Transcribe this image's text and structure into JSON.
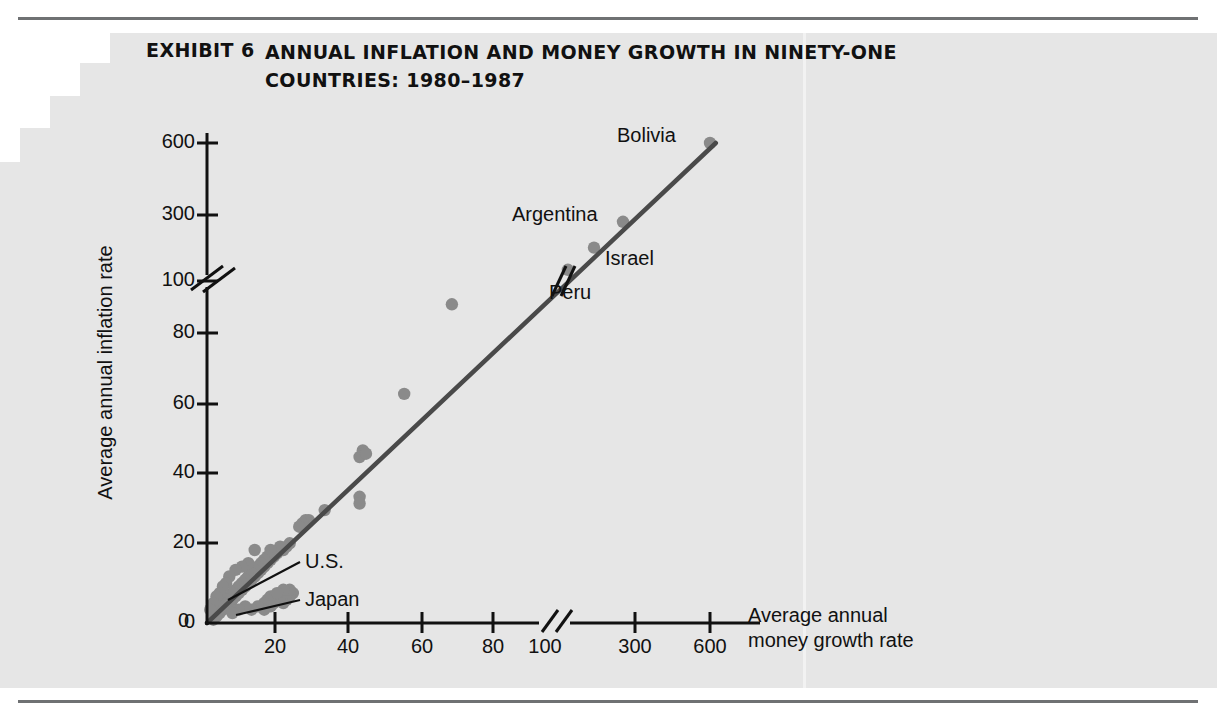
{
  "exhibit": {
    "label": "EXHIBIT 6",
    "title": "ANNUAL INFLATION AND MONEY GROWTH IN NINETY-ONE COUNTRIES: 1980–1987"
  },
  "colors": {
    "page_background": "#ffffff",
    "panel_background": "#e6e6e6",
    "rule": "#6f7173",
    "axis": "#111111",
    "point": "#8a8a8a",
    "trend_line": "#4a4a4a",
    "text": "#111111"
  },
  "chart_data": {
    "type": "scatter",
    "title": "ANNUAL INFLATION AND MONEY GROWTH IN NINETY-ONE COUNTRIES: 1980–1987",
    "xlabel": "Average annual money growth rate",
    "ylabel": "Average annual inflation rate",
    "grid": false,
    "legend": "none",
    "x_ticks": [
      "0",
      "20",
      "40",
      "60",
      "80",
      "100",
      "300",
      "600"
    ],
    "y_ticks": [
      "0",
      "20",
      "40",
      "60",
      "80",
      "100",
      "300",
      "600"
    ],
    "x_axis_break_after": "100",
    "y_axis_break_after": "100",
    "xlim": [
      0,
      600
    ],
    "ylim": [
      0,
      600
    ],
    "trend_line": {
      "description": "45-degree line of best fit from origin through Bolivia",
      "from": [
        0,
        0
      ],
      "to": [
        620,
        620
      ]
    },
    "labeled_points": [
      {
        "name": "Bolivia",
        "x": 600,
        "y": 620
      },
      {
        "name": "Argentina",
        "x": 300,
        "y": 300
      },
      {
        "name": "Israel",
        "x": 200,
        "y": 195
      },
      {
        "name": "Peru",
        "x": 110,
        "y": 105
      },
      {
        "name": "U.S.",
        "x": 8,
        "y": 5
      },
      {
        "name": "Japan",
        "x": 7,
        "y": 2
      }
    ],
    "points": [
      [
        600,
        620
      ],
      [
        300,
        300
      ],
      [
        200,
        195
      ],
      [
        110,
        105
      ],
      [
        77,
        96
      ],
      [
        62,
        69
      ],
      [
        49,
        52
      ],
      [
        49,
        51
      ],
      [
        48,
        50
      ],
      [
        50,
        51
      ],
      [
        48,
        38
      ],
      [
        48,
        36
      ],
      [
        37,
        34
      ],
      [
        32,
        31
      ],
      [
        31,
        31
      ],
      [
        30,
        30
      ],
      [
        29,
        29
      ],
      [
        26,
        24
      ],
      [
        25,
        23
      ],
      [
        24,
        22
      ],
      [
        23,
        23
      ],
      [
        22,
        21
      ],
      [
        21,
        20
      ],
      [
        20,
        22
      ],
      [
        20,
        19
      ],
      [
        19,
        20
      ],
      [
        19,
        18
      ],
      [
        18,
        19
      ],
      [
        18,
        17
      ],
      [
        17,
        18
      ],
      [
        17,
        16
      ],
      [
        16,
        17
      ],
      [
        16,
        15
      ],
      [
        15,
        16
      ],
      [
        15,
        14
      ],
      [
        14,
        15
      ],
      [
        14,
        13
      ],
      [
        13,
        14
      ],
      [
        13,
        12
      ],
      [
        12,
        13
      ],
      [
        12,
        11
      ],
      [
        11,
        12
      ],
      [
        11,
        10
      ],
      [
        10,
        11
      ],
      [
        10,
        9
      ],
      [
        9,
        10
      ],
      [
        9,
        8
      ],
      [
        8,
        9
      ],
      [
        8,
        7
      ],
      [
        7,
        8
      ],
      [
        7,
        6
      ],
      [
        6,
        7
      ],
      [
        6,
        5
      ],
      [
        5,
        6
      ],
      [
        5,
        4
      ],
      [
        4,
        5
      ],
      [
        4,
        3
      ],
      [
        3,
        4
      ],
      [
        3,
        2
      ],
      [
        2,
        3
      ],
      [
        2,
        1
      ],
      [
        27,
        9
      ],
      [
        26,
        8
      ],
      [
        25,
        7
      ],
      [
        24,
        6
      ],
      [
        23,
        8
      ],
      [
        22,
        7
      ],
      [
        21,
        6
      ],
      [
        20,
        8
      ],
      [
        19,
        7
      ],
      [
        18,
        6
      ],
      [
        26,
        10
      ],
      [
        24,
        10
      ],
      [
        22,
        9
      ],
      [
        20,
        5
      ],
      [
        18,
        4
      ],
      [
        16,
        5
      ],
      [
        14,
        4
      ],
      [
        12,
        5
      ],
      [
        10,
        4
      ],
      [
        8,
        3
      ],
      [
        13,
        18
      ],
      [
        11,
        17
      ],
      [
        9,
        16
      ],
      [
        7,
        14
      ],
      [
        6,
        12
      ],
      [
        5,
        11
      ],
      [
        4,
        9
      ],
      [
        3,
        8
      ],
      [
        2,
        6
      ],
      [
        1,
        4
      ],
      [
        15,
        22
      ]
    ]
  },
  "annotations": {
    "bolivia": "Bolivia",
    "argentina": "Argentina",
    "israel": "Israel",
    "peru": "Peru",
    "us": "U.S.",
    "japan": "Japan"
  },
  "axis": {
    "y_label": "Average annual inflation rate",
    "x_label_line1": "Average annual",
    "x_label_line2": "money growth rate",
    "y_ticks": [
      {
        "value": "600",
        "y": 143
      },
      {
        "value": "300",
        "y": 215
      },
      {
        "value": "100",
        "y": 281
      },
      {
        "value": "80",
        "y": 333
      },
      {
        "value": "60",
        "y": 404
      },
      {
        "value": "40",
        "y": 473
      },
      {
        "value": "20",
        "y": 543
      },
      {
        "value": "0",
        "y": 623
      }
    ],
    "x_ticks": [
      {
        "value": "20",
        "x": 275
      },
      {
        "value": "40",
        "x": 348
      },
      {
        "value": "60",
        "x": 422
      },
      {
        "value": "80",
        "x": 493
      },
      {
        "value": "100",
        "x": 545
      },
      {
        "value": "300",
        "x": 635
      },
      {
        "value": "600",
        "x": 710
      }
    ]
  }
}
